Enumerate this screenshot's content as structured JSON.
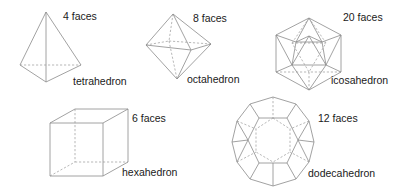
{
  "figure": {
    "solids": [
      {
        "id": "tetrahedron",
        "name": "tetrahedron",
        "faces_label": "4 faces",
        "faces": 4
      },
      {
        "id": "octahedron",
        "name": "octahedron",
        "faces_label": "8 faces",
        "faces": 8
      },
      {
        "id": "icosahedron",
        "name": "icosahedron",
        "faces_label": "20 faces",
        "faces": 20
      },
      {
        "id": "hexahedron",
        "name": "hexahedron",
        "faces_label": "6 faces",
        "faces": 6
      },
      {
        "id": "dodecahedron",
        "name": "dodecahedron",
        "faces_label": "12 faces",
        "faces": 12
      }
    ]
  }
}
